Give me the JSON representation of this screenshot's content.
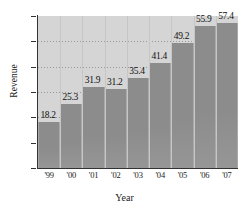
{
  "chart_data": {
    "type": "bar",
    "title": "",
    "xlabel": "Year",
    "ylabel": "Revenue",
    "categories": [
      "'99",
      "'00",
      "'01",
      "'02",
      "'03",
      "'04",
      "'05",
      "'06",
      "'07"
    ],
    "values": [
      18.2,
      25.3,
      31.9,
      31.2,
      35.4,
      41.4,
      49.2,
      55.9,
      57.4
    ],
    "value_labels": [
      "18.2",
      "25.3",
      "31.9",
      "31.2",
      "35.4",
      "41.4",
      "49.2",
      "55.9",
      "57.4"
    ],
    "ylim": [
      0,
      60
    ],
    "yticks": [
      0,
      10,
      20,
      30,
      40,
      50,
      60
    ],
    "ytick_labels": [
      "0",
      "10",
      "20",
      "30",
      "40",
      "50",
      "60"
    ],
    "grid": true,
    "grid_style": "dotted-horizontal",
    "legend": null,
    "colors": {
      "bar_fill": "#8c8c8c",
      "bar_edge": "#a9a9a9",
      "plot_background": "#d5d5d5",
      "axis": "#333333",
      "gridline": "#8e8e8e",
      "text": "#111111",
      "figure_background": "#ffffff"
    }
  }
}
